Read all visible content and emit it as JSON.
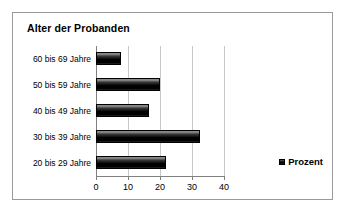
{
  "chart_data": {
    "type": "bar",
    "orientation": "horizontal",
    "title": "Alter der Probanden",
    "categories": [
      "60 bis 69 Jahre",
      "50 bis 59 Jahre",
      "40 bis 49 Jahre",
      "30 bis 39 Jahre",
      "20 bis 29 Jahre"
    ],
    "values": [
      7.8,
      20,
      16.6,
      32.5,
      22
    ],
    "series": [
      {
        "name": "Prozent",
        "values": [
          7.8,
          20,
          16.6,
          32.5,
          22
        ]
      }
    ],
    "xlabel": "",
    "ylabel": "",
    "xlim": [
      0,
      40
    ],
    "xticks": [
      0,
      10,
      20,
      30,
      40
    ],
    "xtick_labels": [
      "0",
      "10",
      "20",
      "30",
      "40"
    ],
    "grid": true,
    "grid_axis": "x",
    "legend": [
      "Prozent"
    ],
    "legend_position": "bottom-right",
    "bar_color": "#000000",
    "grid_color": "#c8c8c8",
    "axis_color": "#808080",
    "border_color": "#9a9a9a",
    "background_color": "#ffffff"
  },
  "legend": {
    "entry_label": "Prozent",
    "swatch_name": "prozent-series-swatch"
  }
}
